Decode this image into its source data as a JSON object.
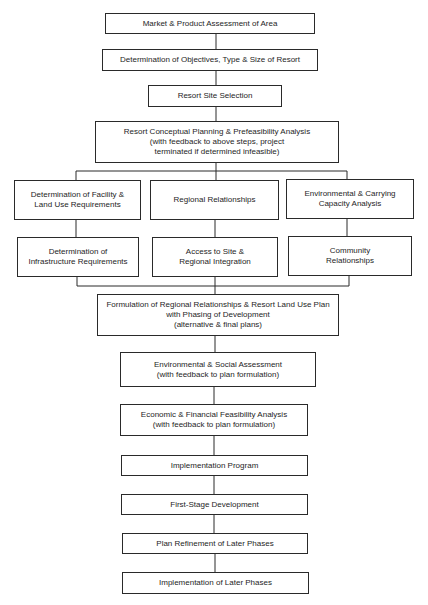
{
  "diagram": {
    "type": "flowchart",
    "steps": [
      {
        "id": "market",
        "label": "Market & Product Assessment of Area"
      },
      {
        "id": "objectives",
        "label": "Determination of Objectives, Type & Size of Resort"
      },
      {
        "id": "site",
        "label": "Resort Site Selection"
      },
      {
        "id": "conceptual",
        "label": "Resort Conceptual Planning & Prefeasibility Analysis\n(with feedback to above steps, project\nterminated if determined infeasible)"
      },
      {
        "id": "facility",
        "label": "Determination of Facility &\nLand Use Requirements"
      },
      {
        "id": "regional",
        "label": "Regional Relationships"
      },
      {
        "id": "environmental",
        "label": "Environmental & Carrying\nCapacity Analysis"
      },
      {
        "id": "infrastructure",
        "label": "Determination of\nInfrastructure Requirements"
      },
      {
        "id": "access",
        "label": "Access to Site &\nRegional Integration"
      },
      {
        "id": "community",
        "label": "Community\nRelationships"
      },
      {
        "id": "formulation",
        "label": "Formulation of Regional Relationships & Resort Land Use Plan\nwith Phasing of Development\n(alternative & final plans)"
      },
      {
        "id": "env_social",
        "label": "Environmental & Social Assessment\n(with feedback to plan formulation)"
      },
      {
        "id": "economic",
        "label": "Economic & Financial Feasibility Analysis\n(with feedback to plan formulation)"
      },
      {
        "id": "impl_program",
        "label": "Implementation Program"
      },
      {
        "id": "first_stage",
        "label": "First-Stage Development"
      },
      {
        "id": "refinement",
        "label": "Plan Refinement of Later Phases"
      },
      {
        "id": "impl_later",
        "label": "Implementation of Later Phases"
      }
    ],
    "edges": [
      [
        "market",
        "objectives"
      ],
      [
        "objectives",
        "site"
      ],
      [
        "site",
        "conceptual"
      ],
      [
        "conceptual",
        "facility"
      ],
      [
        "conceptual",
        "regional"
      ],
      [
        "conceptual",
        "environmental"
      ],
      [
        "facility",
        "infrastructure"
      ],
      [
        "regional",
        "access"
      ],
      [
        "environmental",
        "community"
      ],
      [
        "infrastructure",
        "formulation"
      ],
      [
        "access",
        "formulation"
      ],
      [
        "community",
        "formulation"
      ],
      [
        "formulation",
        "env_social"
      ],
      [
        "env_social",
        "economic"
      ],
      [
        "economic",
        "impl_program"
      ],
      [
        "impl_program",
        "first_stage"
      ],
      [
        "first_stage",
        "refinement"
      ],
      [
        "refinement",
        "impl_later"
      ]
    ]
  }
}
